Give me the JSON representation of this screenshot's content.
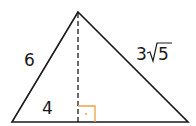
{
  "diagram": {
    "type": "triangle-with-altitude",
    "labels": {
      "left_side": "6",
      "right_side_coef": "3",
      "right_side_radicand": "5",
      "base_left_segment": "4"
    },
    "colors": {
      "stroke": "#1a1a1a",
      "right_angle_marker": "#f0a040"
    }
  }
}
